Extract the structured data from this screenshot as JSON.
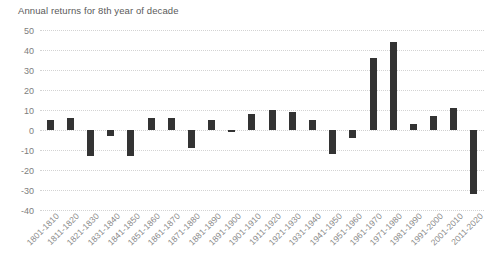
{
  "chart_data": {
    "type": "bar",
    "title": "Annual returns for 8th year of decade",
    "xlabel": "",
    "ylabel": "",
    "ylim": [
      -40,
      50
    ],
    "ytick_step": 10,
    "yticks": [
      50,
      40,
      30,
      20,
      10,
      0,
      -10,
      -20,
      -30,
      -40
    ],
    "grid": true,
    "legend": "none",
    "bar_color": "#333333",
    "gridline_color": "#d3d3d3",
    "axis_label_color": "#8a8a8a",
    "background": "#ffffff",
    "categories": [
      "1801-1810",
      "1811-1820",
      "1821-1830",
      "1831-1840",
      "1841-1850",
      "1851-1860",
      "1861-1870",
      "1871-1880",
      "1881-1890",
      "1891-1900",
      "1901-1910",
      "1911-1920",
      "1921-1930",
      "1931-1940",
      "1941-1950",
      "1951-1960",
      "1961-1970",
      "1971-1980",
      "1981-1990",
      "1991-2000",
      "2001-2010",
      "2011-2020"
    ],
    "values": [
      5,
      6,
      -13,
      -3,
      -13,
      6,
      6,
      -9,
      5,
      -1,
      8,
      10,
      9,
      5,
      -12,
      -4,
      36,
      44,
      3,
      7,
      11,
      -32
    ]
  }
}
